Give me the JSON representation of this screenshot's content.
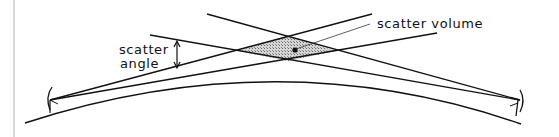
{
  "diagram": {
    "type": "tropospheric-scatter-geometry",
    "labels": {
      "scatter_volume": "scatter volume",
      "scatter_angle_line1": "scatter",
      "scatter_angle_line2": "angle"
    },
    "elements": {
      "earth_surface": "curved-earth-arc",
      "transmitter_antenna": "dish-antenna-left",
      "receiver_antenna": "dish-antenna-right",
      "beams": 4,
      "scatter_region": "hatched-diamond",
      "scatter_angle_marker": "double-arrow"
    },
    "colors": {
      "line": "#111111",
      "hatch": "#9a9a9a",
      "border": "#d8d8d8"
    }
  }
}
